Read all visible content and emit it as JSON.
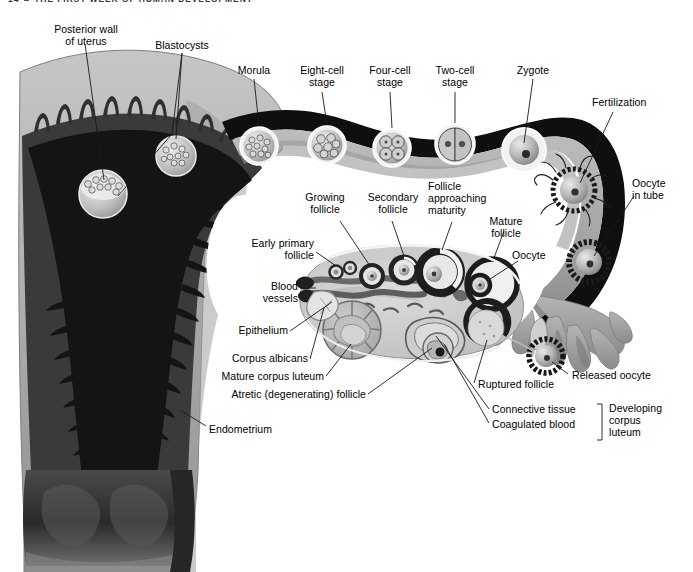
{
  "page": {
    "running_head_number": "14",
    "running_head_title": "THE FIRST WEEK OF HUMAN DEVELOPMENT",
    "bullet_icon": "square-bullet-icon"
  },
  "colors": {
    "page_background": "#ffffff",
    "myometrium_light": "#b9b9b9",
    "myometrium_mid": "#9a9a9a",
    "endometrium_dark": "#3a3a3a",
    "cavity_black": "#141414",
    "tube_outline": "#111111",
    "tube_lumen": "#adadad",
    "ovary_stroma": "#c9c9c9",
    "ovary_pale": "#dedede",
    "vessel_gray": "#6f6f6f",
    "leader_line": "#1a1a1a",
    "label_text": "#000000",
    "runhead_text": "#3a3a3a"
  },
  "labels": {
    "posterior_wall": "Posterior wall\nof uterus",
    "blastocysts": "Blastocysts",
    "morula": "Morula",
    "eight_cell": "Eight-cell\nstage",
    "four_cell": "Four-cell\nstage",
    "two_cell": "Two-cell\nstage",
    "zygote": "Zygote",
    "fertilization": "Fertilization",
    "oocyte_in_tube": "Oocyte\nin tube",
    "growing_follicle": "Growing\nfollicle",
    "secondary_follicle": "Secondary\nfollicle",
    "follicle_approaching_maturity": "Follicle\napproaching\nmaturity",
    "mature_follicle": "Mature\nfollicle",
    "oocyte": "Oocyte",
    "early_primary_follicle": "Early primary\nfollicle",
    "blood_vessels": "Blood\nvessels",
    "epithelium": "Epithelium",
    "corpus_albicans": "Corpus albicans",
    "mature_corpus_luteum": "Mature corpus luteum",
    "atretic_follicle": "Atretic (degenerating) follicle",
    "endometrium": "Endometrium",
    "released_oocyte": "Released oocyte",
    "ruptured_follicle": "Ruptured follicle",
    "connective_tissue": "Connective tissue",
    "coagulated_blood": "Coagulated blood",
    "developing_corpus_luteum": "Developing\ncorpus\nluteum"
  }
}
